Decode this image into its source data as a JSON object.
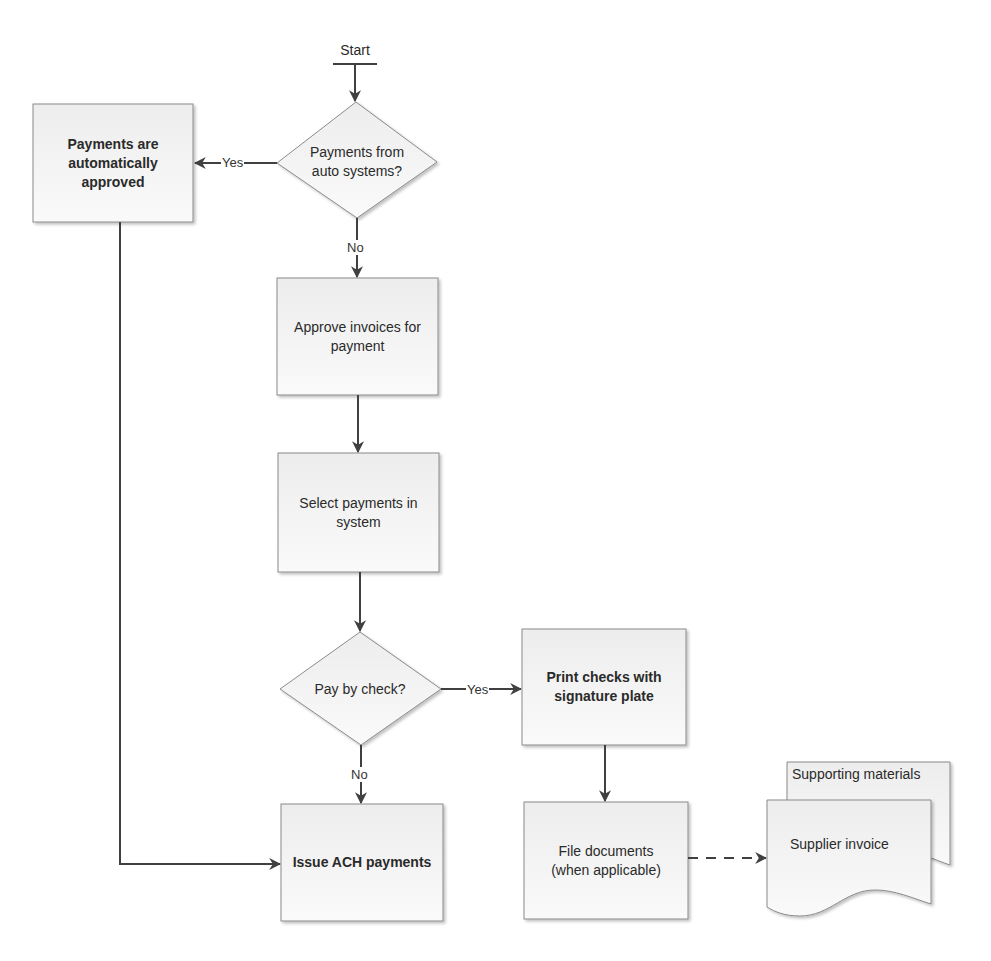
{
  "diagram": {
    "type": "flowchart",
    "start": {
      "label": "Start"
    },
    "nodes": [
      {
        "id": "auto_check",
        "shape": "diamond",
        "label_lines": [
          "Payments from",
          "auto systems?"
        ],
        "bold": false
      },
      {
        "id": "auto_approved",
        "shape": "process",
        "label_lines": [
          "Payments are",
          "automatically",
          "approved"
        ],
        "bold": true
      },
      {
        "id": "approve_invoices",
        "shape": "process",
        "label_lines": [
          "Approve invoices for",
          "payment"
        ],
        "bold": false
      },
      {
        "id": "select_payments",
        "shape": "process",
        "label_lines": [
          "Select payments in",
          "system"
        ],
        "bold": false
      },
      {
        "id": "pay_by_check",
        "shape": "diamond",
        "label_lines": [
          "Pay by check?"
        ],
        "bold": false
      },
      {
        "id": "print_checks",
        "shape": "process",
        "label_lines": [
          "Print checks with",
          "signature plate"
        ],
        "bold": true
      },
      {
        "id": "issue_ach",
        "shape": "process",
        "label_lines": [
          "Issue ACH payments"
        ],
        "bold": true
      },
      {
        "id": "file_documents",
        "shape": "process",
        "label_lines": [
          "File documents",
          "(when applicable)"
        ],
        "bold": false
      },
      {
        "id": "documents",
        "shape": "multi-document",
        "label_lines": [
          "Supplier invoice"
        ],
        "back_label": "Supporting materials",
        "bold": false
      }
    ],
    "edges": [
      {
        "from": "start",
        "to": "auto_check",
        "label": "",
        "style": "solid"
      },
      {
        "from": "auto_check",
        "to": "auto_approved",
        "label": "Yes",
        "style": "solid"
      },
      {
        "from": "auto_check",
        "to": "approve_invoices",
        "label": "No",
        "style": "solid"
      },
      {
        "from": "approve_invoices",
        "to": "select_payments",
        "label": "",
        "style": "solid"
      },
      {
        "from": "select_payments",
        "to": "pay_by_check",
        "label": "",
        "style": "solid"
      },
      {
        "from": "pay_by_check",
        "to": "print_checks",
        "label": "Yes",
        "style": "solid"
      },
      {
        "from": "pay_by_check",
        "to": "issue_ach",
        "label": "No",
        "style": "solid"
      },
      {
        "from": "auto_approved",
        "to": "issue_ach",
        "label": "",
        "style": "solid"
      },
      {
        "from": "print_checks",
        "to": "file_documents",
        "label": "",
        "style": "solid"
      },
      {
        "from": "file_documents",
        "to": "documents",
        "label": "",
        "style": "dashed"
      }
    ],
    "edge_labels": {
      "auto_yes": "Yes",
      "auto_no": "No",
      "check_yes": "Yes",
      "check_no": "No"
    },
    "colors": {
      "stroke": "#7f7f7f",
      "arrow": "#404040",
      "fill_top": "#ececec",
      "fill_bottom": "#fbfbfb",
      "text": "#2a2a2a"
    }
  }
}
